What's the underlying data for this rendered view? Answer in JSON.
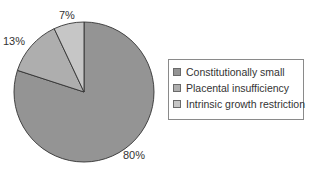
{
  "chart_data": {
    "type": "pie",
    "title": "",
    "categories": [
      "Constitutionally small",
      "Placental insufficiency",
      "Intrinsic growth restriction"
    ],
    "values": [
      80,
      13,
      7
    ],
    "labels": [
      "80%",
      "13%",
      "7%"
    ],
    "colors": [
      "#949494",
      "#aeaeae",
      "#c6c6c6"
    ],
    "start_angle_deg": 0,
    "direction": "clockwise from 12 o'clock",
    "legend_position": "right"
  },
  "labels": {
    "a": "80%",
    "b": "13%",
    "c": "7%"
  },
  "legend": {
    "items": [
      {
        "label": "Constitutionally small",
        "color": "#949494"
      },
      {
        "label": "Placental insufficiency",
        "color": "#aeaeae"
      },
      {
        "label": "Intrinsic growth restriction",
        "color": "#c6c6c6"
      }
    ]
  }
}
